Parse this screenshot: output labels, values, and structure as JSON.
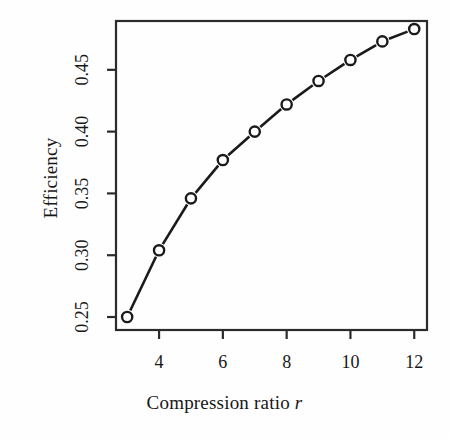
{
  "chart_data": {
    "type": "line",
    "title": "",
    "subtitle": "",
    "xlabel": "Compression ratio r",
    "xlabel_plain": "Compression ratio",
    "xlabel_variable": "r",
    "ylabel": "Efficiency",
    "x": [
      3,
      4,
      5,
      6,
      7,
      8,
      9,
      10,
      11,
      12
    ],
    "values": [
      0.25,
      0.304,
      0.346,
      0.377,
      0.4,
      0.422,
      0.441,
      0.458,
      0.473,
      0.483
    ],
    "series": [
      {
        "name": "Efficiency",
        "values": [
          0.25,
          0.304,
          0.346,
          0.377,
          0.4,
          0.422,
          0.441,
          0.458,
          0.473,
          0.483
        ]
      }
    ],
    "xlim": [
      2.65,
      12.4
    ],
    "ylim": [
      0.2395,
      0.4895
    ],
    "xticks": [
      4,
      6,
      8,
      10,
      12
    ],
    "xtick_labels": [
      "4",
      "6",
      "8",
      "10",
      "12"
    ],
    "yticks": [
      0.25,
      0.3,
      0.35,
      0.4,
      0.45
    ],
    "ytick_labels": [
      "0.25",
      "0.30",
      "0.35",
      "0.40",
      "0.45"
    ],
    "grid": false,
    "legend": false,
    "legend_position": "none",
    "marker": "open-circle",
    "line_style": "solid",
    "line_color": "#1a1a1a",
    "marker_face_color": "#ffffff",
    "marker_edge_color": "#1a1a1a",
    "box_border": true,
    "background_color": "#fefefe",
    "annotations": []
  },
  "axes": {
    "x_title": "Compression ratio",
    "x_title_variable": "r",
    "y_title": "Efficiency"
  }
}
